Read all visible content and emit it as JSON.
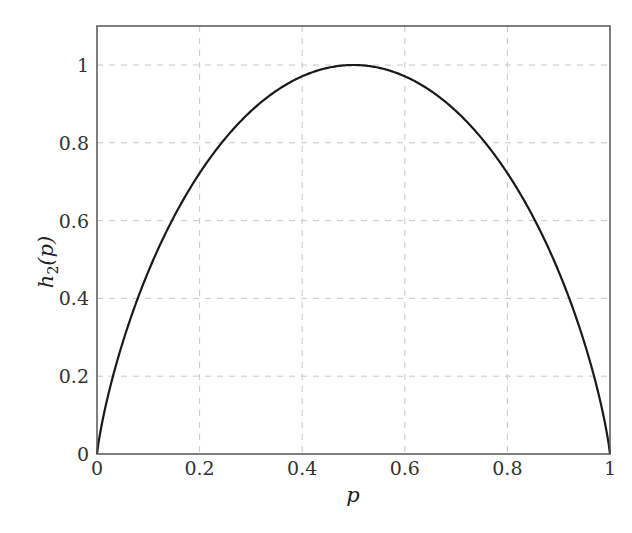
{
  "chart_data": {
    "type": "line",
    "title": "",
    "xlabel": "p",
    "ylabel": "h2(p)",
    "ylabel_main": "h",
    "ylabel_sub": "2",
    "ylabel_arg": "(p)",
    "xlim": [
      0,
      1
    ],
    "ylim": [
      0,
      1.1
    ],
    "grid": true,
    "grid_style": "dashed",
    "legend": null,
    "x_ticks": [
      0,
      0.2,
      0.4,
      0.6,
      0.8,
      1
    ],
    "x_tick_labels": [
      "0",
      "0.2",
      "0.4",
      "0.6",
      "0.8",
      "1"
    ],
    "y_ticks": [
      0,
      0.2,
      0.4,
      0.6,
      0.8,
      1
    ],
    "y_tick_labels": [
      "0",
      "0.2",
      "0.4",
      "0.6",
      "0.8",
      "1"
    ],
    "series": [
      {
        "name": "binary entropy h2(p)",
        "color": "#1a1a1a",
        "function": "-p*log2(p)-(1-p)*log2(1-p)",
        "x": [
          0,
          0.05,
          0.1,
          0.15,
          0.2,
          0.25,
          0.3,
          0.35,
          0.4,
          0.45,
          0.5,
          0.55,
          0.6,
          0.65,
          0.7,
          0.75,
          0.8,
          0.85,
          0.9,
          0.95,
          1
        ],
        "values": [
          0,
          0.286,
          0.469,
          0.61,
          0.722,
          0.811,
          0.881,
          0.934,
          0.971,
          0.993,
          1,
          0.993,
          0.971,
          0.934,
          0.881,
          0.811,
          0.722,
          0.61,
          0.469,
          0.286,
          0
        ]
      }
    ]
  },
  "colors": {
    "frame": "#555555",
    "grid": "#c8c8c8",
    "curve": "#1a1a1a"
  }
}
